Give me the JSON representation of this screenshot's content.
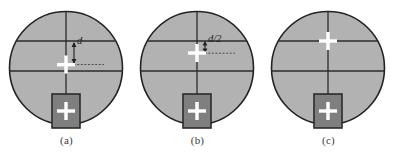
{
  "figure": {
    "type": "diagram",
    "background_color": "#ffffff",
    "panel_count": 3
  },
  "style": {
    "circle_fill": "#b2b2b2",
    "circle_stroke": "#232323",
    "reticle_line_color": "#2b2b2b",
    "rect_fill": "#7f7f7f",
    "rect_stroke": "#2b2b2b",
    "cross_color": "#ffffff",
    "annotation_color": "#202020",
    "caption_color": "#3b3b3b"
  },
  "panels": [
    {
      "id": "a",
      "caption": "(a)",
      "annotation": "d",
      "annotation_present": true,
      "cross_offset_label": "d",
      "cross_offset_px": 24,
      "cross_on_line": false
    },
    {
      "id": "b",
      "caption": "(b)",
      "annotation": "d/2",
      "annotation_present": true,
      "cross_offset_label": "d/2",
      "cross_offset_px": 12,
      "cross_on_line": false
    },
    {
      "id": "c",
      "caption": "(c)",
      "annotation": "",
      "annotation_present": false,
      "cross_offset_label": "0",
      "cross_offset_px": 0,
      "cross_on_line": true
    }
  ],
  "geometry": {
    "circle_center_x": 66,
    "circle_center_y": 68,
    "circle_radius": 57,
    "upper_line_y": 41,
    "middle_line_y": 71,
    "vertical_line_x": 66,
    "rect_x": 52,
    "rect_y": 94,
    "rect_width": 28,
    "rect_height": 34,
    "rect_cross_y": 111,
    "cross_arm_length": 9,
    "cross_thickness": 3
  }
}
